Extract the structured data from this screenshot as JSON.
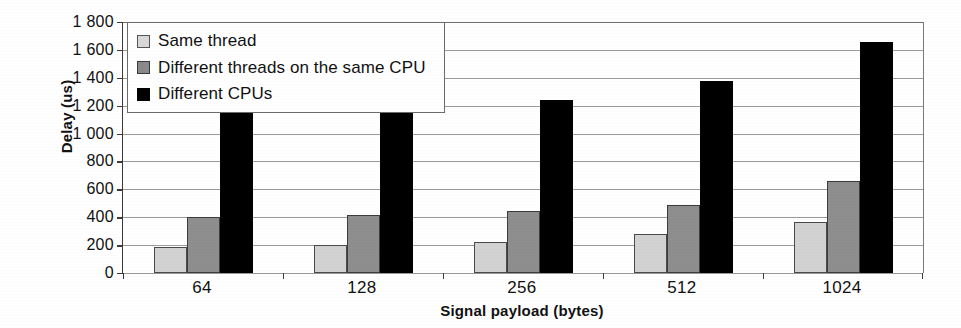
{
  "chart_data": {
    "type": "bar",
    "title": "",
    "xlabel": "Signal payload (bytes)",
    "ylabel": "Delay (us)",
    "categories": [
      "64",
      "128",
      "256",
      "512",
      "1024"
    ],
    "series": [
      {
        "name": "Same thread",
        "values": [
          185,
          200,
          225,
          280,
          365
        ],
        "color": "#d2d2d2"
      },
      {
        "name": "Different threads on the same CPU",
        "values": [
          405,
          415,
          445,
          490,
          660
        ],
        "color": "#8e8e8e"
      },
      {
        "name": "Different CPUs",
        "values": [
          1160,
          1190,
          1240,
          1375,
          1660
        ],
        "color": "#000000"
      }
    ],
    "ylim": [
      0,
      1800
    ],
    "ytick_step": 200,
    "ytick_labels": [
      "1 800",
      "1 600",
      "1 400",
      "1 200",
      "1 000",
      "800",
      "600",
      "400",
      "200",
      "0"
    ],
    "ytick_values": [
      1800,
      1600,
      1400,
      1200,
      1000,
      800,
      600,
      400,
      200,
      0
    ],
    "grid": true,
    "legend_position": "top-left"
  },
  "axes": {
    "y_title": "Delay (us)",
    "x_title": "Signal payload (bytes)"
  },
  "legend": {
    "items": [
      {
        "label": "Same thread"
      },
      {
        "label": "Different threads on the same CPU"
      },
      {
        "label": "Different CPUs"
      }
    ]
  }
}
